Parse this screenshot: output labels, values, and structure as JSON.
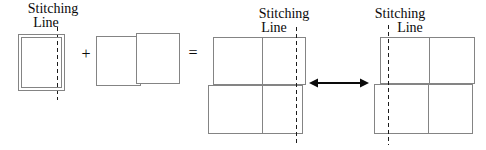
{
  "diagram": {
    "labels": {
      "input": {
        "line1": "Stitching",
        "line2": "Line"
      },
      "result_left": {
        "line1": "Stitching",
        "line2": "Line"
      },
      "result_right": {
        "line1": "Stitching",
        "line2": "Line"
      }
    },
    "operators": {
      "plus": "+",
      "equals": "="
    },
    "colors": {
      "background": "#ffffff",
      "box_border": "#848484",
      "dashed_line": "#1c1c1c",
      "text": "#0a0a0a",
      "arrow": "#0a0a0a"
    }
  }
}
